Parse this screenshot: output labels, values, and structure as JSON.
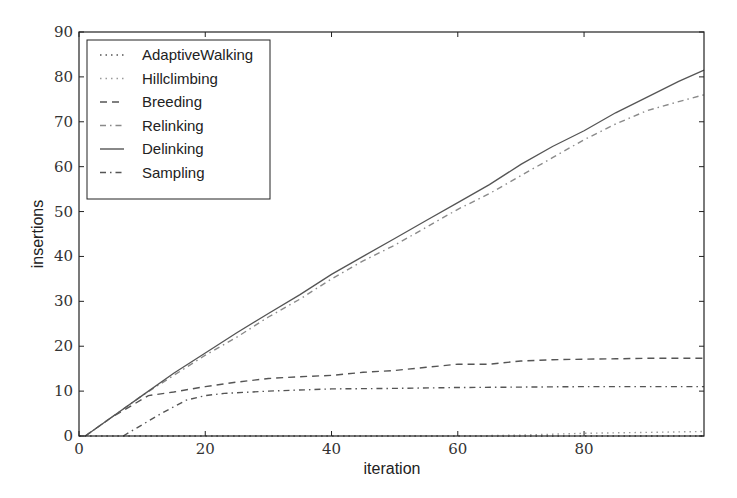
{
  "chart_data": {
    "type": "line",
    "title": "",
    "xlabel": "iteration",
    "ylabel": "insertions",
    "xlim": [
      0,
      99
    ],
    "ylim": [
      0,
      90
    ],
    "xticks": [
      0,
      20,
      40,
      60,
      80
    ],
    "yticks": [
      0,
      10,
      20,
      30,
      40,
      50,
      60,
      70,
      80,
      90
    ],
    "grid": false,
    "legend_position": "upper left",
    "series": [
      {
        "name": "AdaptiveWalking",
        "style": "dotted",
        "color": "#555555",
        "x": [
          0,
          20,
          40,
          60,
          80,
          99
        ],
        "values": [
          0,
          0,
          0,
          0,
          0,
          0
        ]
      },
      {
        "name": "Hillclimbing",
        "style": "dotted",
        "color": "#9a9a9a",
        "x": [
          0,
          20,
          40,
          60,
          70,
          80,
          90,
          99
        ],
        "values": [
          0,
          0,
          0,
          0,
          0.2,
          0.6,
          0.8,
          1.0
        ]
      },
      {
        "name": "Breeding",
        "style": "dashed",
        "color": "#555555",
        "x": [
          1,
          5,
          11,
          15,
          20,
          25,
          30,
          35,
          40,
          45,
          50,
          55,
          60,
          65,
          70,
          75,
          80,
          85,
          90,
          95,
          99
        ],
        "values": [
          0,
          4,
          9,
          9.8,
          11,
          12,
          12.8,
          13.2,
          13.5,
          14.2,
          14.6,
          15.3,
          16,
          16,
          16.7,
          17,
          17.1,
          17.2,
          17.3,
          17.3,
          17.3
        ]
      },
      {
        "name": "Relinking",
        "style": "dashdot",
        "color": "#8a8a8a",
        "x": [
          1,
          5,
          10,
          15,
          20,
          25,
          30,
          35,
          40,
          45,
          50,
          55,
          60,
          65,
          70,
          75,
          80,
          85,
          90,
          95,
          99
        ],
        "values": [
          0,
          4,
          9,
          13.5,
          18,
          22,
          26.5,
          30.5,
          35,
          39,
          42.5,
          46.5,
          50.5,
          54,
          58,
          62,
          66,
          69.5,
          72.5,
          74.5,
          76
        ]
      },
      {
        "name": "Delinking",
        "style": "solid",
        "color": "#555555",
        "x": [
          1,
          5,
          10,
          15,
          20,
          25,
          30,
          35,
          40,
          45,
          50,
          55,
          60,
          65,
          70,
          75,
          80,
          85,
          90,
          95,
          99
        ],
        "values": [
          0,
          4,
          9,
          14,
          18.5,
          23,
          27.3,
          31.5,
          36,
          40,
          44,
          48,
          52,
          56,
          60.5,
          64.5,
          68,
          72,
          75.5,
          79,
          81.5
        ]
      },
      {
        "name": "Sampling",
        "style": "dashdot",
        "color": "#555555",
        "x": [
          7,
          10,
          13,
          17,
          20,
          23,
          30,
          40,
          50,
          60,
          70,
          80,
          90,
          99
        ],
        "values": [
          0,
          2.5,
          5,
          8,
          9,
          9.5,
          10,
          10.5,
          10.6,
          10.8,
          10.9,
          11,
          11,
          11
        ]
      }
    ]
  }
}
